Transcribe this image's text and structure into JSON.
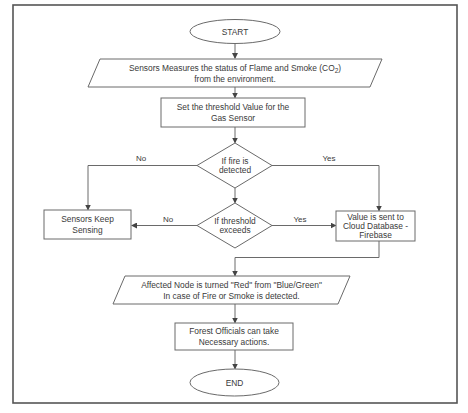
{
  "diagram": {
    "type": "flowchart",
    "nodes": {
      "start": {
        "shape": "terminal",
        "label": "START"
      },
      "measure": {
        "shape": "io",
        "line1": "Sensors Measures the status of Flame and Smoke (CO",
        "subscript": "2",
        "line1_end": ")",
        "line2": "from the environment."
      },
      "threshold": {
        "shape": "process",
        "line1": "Set the threshold Value for the",
        "line2": "Gas Sensor"
      },
      "fire_decision": {
        "shape": "decision",
        "line1": "If fire is",
        "line2": "detected"
      },
      "threshold_decision": {
        "shape": "decision",
        "line1": "If threshold",
        "line2": "exceeds"
      },
      "keep_sensing": {
        "shape": "process",
        "line1": "Sensors Keep",
        "line2": "Sensing"
      },
      "cloud": {
        "shape": "process",
        "line1": "Value is sent to",
        "line2": "Cloud Database -",
        "line3": "Firebase"
      },
      "node_red": {
        "shape": "io",
        "line1": "Affected Node is turned \"Red\" from \"Blue/Green\"",
        "line2": "In case of Fire or Smoke is detected."
      },
      "officials": {
        "shape": "process",
        "line1": "Forest Officials can take",
        "line2": "Necessary actions."
      },
      "end": {
        "shape": "terminal",
        "label": "END"
      }
    },
    "edges": {
      "fire_no": "No",
      "fire_yes": "Yes",
      "threshold_no": "No",
      "threshold_yes": "Yes"
    },
    "colors": {
      "stroke": "#6a6a6a",
      "frame": "#555555",
      "text": "#3a3a3a",
      "background": "#ffffff"
    }
  }
}
